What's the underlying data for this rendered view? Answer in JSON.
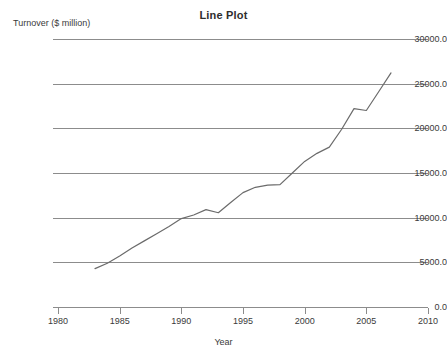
{
  "chart_data": {
    "type": "line",
    "title": "Line Plot",
    "xlabel": "Year",
    "ylabel": "Turnover ($ million)",
    "xlim": [
      1980,
      2010
    ],
    "ylim": [
      0,
      30000
    ],
    "grid": true,
    "legend": false,
    "line_color": "#6b6b6b",
    "xticks": [
      1980,
      1985,
      1990,
      1995,
      2000,
      2005,
      2010
    ],
    "xtick_labels": [
      "1980",
      "1985",
      "1990",
      "1995",
      "2000",
      "2005",
      "2010"
    ],
    "yticks": [
      0,
      5000,
      10000,
      15000,
      20000,
      25000,
      30000
    ],
    "ytick_labels": [
      "0.0",
      "5000.0",
      "10000.0",
      "15000.0",
      "20000.0",
      "25000.0",
      "30000.0"
    ],
    "series": [
      {
        "name": "Turnover",
        "x": [
          1983,
          1984,
          1985,
          1986,
          1987,
          1988,
          1989,
          1990,
          1991,
          1992,
          1993,
          1994,
          1995,
          1996,
          1997,
          1998,
          1999,
          2000,
          2001,
          2002,
          2003,
          2004,
          2005,
          2006,
          2007
        ],
        "values": [
          4300,
          4900,
          5700,
          6600,
          7400,
          8200,
          9000,
          9900,
          10300,
          10900,
          10550,
          11700,
          12800,
          13400,
          13650,
          13700,
          15000,
          16300,
          17200,
          17900,
          19900,
          22200,
          22000,
          24100,
          26200
        ]
      }
    ]
  }
}
